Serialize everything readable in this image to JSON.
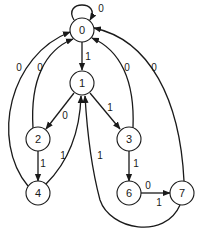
{
  "diagram": {
    "type": "state-transition",
    "nodes": [
      {
        "id": "0",
        "label": "0",
        "x": 82,
        "y": 30
      },
      {
        "id": "1",
        "label": "1",
        "x": 82,
        "y": 83
      },
      {
        "id": "2",
        "label": "2",
        "x": 38,
        "y": 139
      },
      {
        "id": "3",
        "label": "3",
        "x": 129,
        "y": 139
      },
      {
        "id": "4",
        "label": "4",
        "x": 38,
        "y": 193
      },
      {
        "id": "6",
        "label": "6",
        "x": 129,
        "y": 193
      },
      {
        "id": "7",
        "label": "7",
        "x": 182,
        "y": 193
      }
    ],
    "edges": [
      {
        "from": "0",
        "to": "0",
        "label": "0"
      },
      {
        "from": "0",
        "to": "1",
        "label": "1"
      },
      {
        "from": "1",
        "to": "2",
        "label": "0"
      },
      {
        "from": "1",
        "to": "3",
        "label": "1"
      },
      {
        "from": "2",
        "to": "0",
        "label": "0"
      },
      {
        "from": "3",
        "to": "0",
        "label": "0"
      },
      {
        "from": "4",
        "to": "0",
        "label": "0"
      },
      {
        "from": "7",
        "to": "0",
        "label": "0"
      },
      {
        "from": "2",
        "to": "4",
        "label": "1"
      },
      {
        "from": "4",
        "to": "1",
        "label": "1"
      },
      {
        "from": "3",
        "to": "6",
        "label": "1"
      },
      {
        "from": "6",
        "to": "7",
        "label": "0",
        "label2": "1"
      },
      {
        "from": "7",
        "to": "1",
        "label": "1"
      }
    ]
  }
}
